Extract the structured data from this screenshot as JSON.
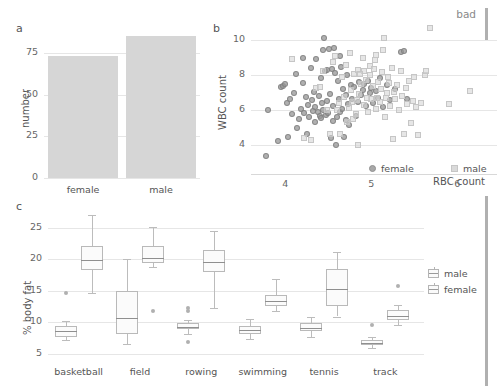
{
  "annotation": {
    "bad_label": "bad"
  },
  "panels": {
    "a": {
      "letter": "a",
      "ylabel": "number",
      "yticks": [
        "0",
        "25",
        "50",
        "75"
      ],
      "categories": [
        "female",
        "male"
      ]
    },
    "b": {
      "letter": "b",
      "ylabel": "WBC count",
      "xlabel": "RBC count",
      "yticks": [
        "4",
        "6",
        "8",
        "10"
      ],
      "xticks": [
        "4",
        "5",
        "6"
      ],
      "legend": [
        "female",
        "male"
      ]
    },
    "c": {
      "letter": "c",
      "ylabel": "% body fat",
      "yticks": [
        "5",
        "10",
        "15",
        "20",
        "25"
      ],
      "categories": [
        "basketball",
        "field",
        "rowing",
        "swimming",
        "tennis",
        "track"
      ],
      "legend": [
        "male",
        "female"
      ]
    }
  },
  "colors": {
    "bar_fill": "#d6d6d6",
    "female_point": "#999999",
    "male_point": "#d6d6d6",
    "grid": "#e6e6e6",
    "text": "#555555",
    "box_stroke": "#b9b9b9",
    "median": "#8f8f8f"
  },
  "chart_data": [
    {
      "id": "panel-a",
      "type": "bar",
      "title": "",
      "xlabel": "",
      "ylabel": "number",
      "categories": [
        "female",
        "male"
      ],
      "values": [
        73,
        85
      ],
      "ylim": [
        0,
        90
      ],
      "yticks": [
        0,
        25,
        50,
        75
      ],
      "grid": true
    },
    {
      "id": "panel-b",
      "type": "scatter",
      "title": "",
      "xlabel": "RBC count",
      "ylabel": "WBC count",
      "xlim": [
        3.6,
        6.3
      ],
      "ylim": [
        3.0,
        11.0
      ],
      "xticks": [
        4,
        5,
        6
      ],
      "yticks": [
        4,
        6,
        8,
        10
      ],
      "grid": true,
      "legend": [
        "female",
        "male"
      ],
      "legend_position": "bottom-right",
      "series": [
        {
          "name": "female",
          "marker": "circle",
          "color": "#999999",
          "points": [
            [
              3.78,
              3.35
            ],
            [
              3.8,
              5.98
            ],
            [
              3.92,
              4.18
            ],
            [
              3.95,
              7.3
            ],
            [
              3.97,
              7.35
            ],
            [
              4.0,
              7.45
            ],
            [
              4.02,
              6.4
            ],
            [
              4.03,
              4.45
            ],
            [
              4.05,
              6.62
            ],
            [
              4.08,
              5.72
            ],
            [
              4.1,
              6.95
            ],
            [
              4.12,
              8.05
            ],
            [
              4.14,
              4.95
            ],
            [
              4.16,
              5.48
            ],
            [
              4.18,
              6.05
            ],
            [
              4.2,
              7.52
            ],
            [
              4.21,
              8.92
            ],
            [
              4.22,
              5.8
            ],
            [
              4.24,
              6.7
            ],
            [
              4.25,
              4.62
            ],
            [
              4.26,
              6.25
            ],
            [
              4.28,
              5.58
            ],
            [
              4.3,
              8.38
            ],
            [
              4.31,
              6.52
            ],
            [
              4.32,
              5.92
            ],
            [
              4.33,
              7.02
            ],
            [
              4.34,
              6.12
            ],
            [
              4.35,
              5.3
            ],
            [
              4.36,
              8.9
            ],
            [
              4.38,
              5.85
            ],
            [
              4.39,
              6.78
            ],
            [
              4.4,
              5.62
            ],
            [
              4.41,
              7.78
            ],
            [
              4.42,
              5.5
            ],
            [
              4.43,
              6.38
            ],
            [
              4.44,
              5.95
            ],
            [
              4.45,
              10.1
            ],
            [
              4.46,
              8.22
            ],
            [
              4.47,
              5.7
            ],
            [
              4.48,
              6.48
            ],
            [
              4.49,
              8.28
            ],
            [
              4.5,
              5.78
            ],
            [
              4.51,
              9.48
            ],
            [
              4.52,
              6.9
            ],
            [
              4.53,
              4.4
            ],
            [
              4.54,
              8.3
            ],
            [
              4.55,
              5.35
            ],
            [
              4.56,
              6.18
            ],
            [
              4.57,
              9.52
            ],
            [
              4.58,
              8.1
            ],
            [
              4.59,
              3.98
            ],
            [
              4.6,
              5.55
            ],
            [
              4.61,
              7.62
            ],
            [
              4.62,
              6.58
            ],
            [
              4.63,
              9.08
            ],
            [
              4.64,
              5.88
            ],
            [
              4.65,
              8.45
            ],
            [
              4.66,
              6.05
            ],
            [
              4.67,
              7.18
            ],
            [
              4.68,
              4.42
            ],
            [
              4.7,
              5.42
            ],
            [
              4.71,
              6.85
            ],
            [
              4.72,
              7.95
            ],
            [
              4.73,
              6.3
            ],
            [
              4.74,
              5.12
            ],
            [
              4.76,
              7.4
            ],
            [
              4.78,
              6.62
            ],
            [
              4.8,
              7.28
            ],
            [
              4.82,
              5.65
            ],
            [
              4.84,
              6.45
            ],
            [
              4.86,
              7.55
            ],
            [
              4.88,
              6.82
            ],
            [
              4.9,
              7.12
            ],
            [
              4.92,
              7.45
            ],
            [
              4.94,
              6.2
            ],
            [
              4.96,
              7.65
            ],
            [
              4.98,
              6.95
            ],
            [
              5.0,
              7.22
            ],
            [
              5.02,
              6.35
            ],
            [
              5.05,
              7.05
            ],
            [
              5.08,
              6.68
            ],
            [
              5.1,
              7.82
            ],
            [
              5.14,
              6.15
            ],
            [
              5.18,
              7.38
            ],
            [
              5.22,
              6.55
            ],
            [
              5.28,
              7.2
            ],
            [
              5.34,
              9.3
            ],
            [
              5.38,
              9.35
            ],
            [
              5.42,
              6.6
            ],
            [
              4.44,
              9.42
            ]
          ]
        },
        {
          "name": "male",
          "marker": "square",
          "color": "#d6d6d6",
          "points": [
            [
              4.08,
              8.88
            ],
            [
              4.22,
              4.35
            ],
            [
              4.3,
              4.28
            ],
            [
              4.36,
              7.22
            ],
            [
              4.4,
              7.3
            ],
            [
              4.44,
              8.18
            ],
            [
              4.48,
              6.0
            ],
            [
              4.52,
              4.62
            ],
            [
              4.56,
              8.72
            ],
            [
              4.58,
              9.05
            ],
            [
              4.6,
              5.95
            ],
            [
              4.62,
              6.35
            ],
            [
              4.64,
              4.58
            ],
            [
              4.66,
              7.88
            ],
            [
              4.68,
              6.72
            ],
            [
              4.7,
              8.55
            ],
            [
              4.72,
              5.3
            ],
            [
              4.74,
              6.1
            ],
            [
              4.75,
              9.22
            ],
            [
              4.76,
              7.12
            ],
            [
              4.78,
              6.45
            ],
            [
              4.8,
              8.02
            ],
            [
              4.82,
              5.72
            ],
            [
              4.84,
              8.28
            ],
            [
              4.85,
              3.95
            ],
            [
              4.86,
              6.88
            ],
            [
              4.88,
              7.48
            ],
            [
              4.9,
              8.92
            ],
            [
              4.92,
              6.28
            ],
            [
              4.94,
              7.7
            ],
            [
              4.96,
              5.88
            ],
            [
              4.98,
              8.48
            ],
            [
              5.0,
              6.62
            ],
            [
              5.02,
              7.32
            ],
            [
              5.04,
              8.82
            ],
            [
              5.05,
              9.1
            ],
            [
              5.06,
              6.02
            ],
            [
              5.08,
              7.58
            ],
            [
              5.1,
              6.42
            ],
            [
              5.12,
              8.12
            ],
            [
              5.14,
              9.38
            ],
            [
              5.15,
              10.08
            ],
            [
              5.16,
              5.6
            ],
            [
              5.18,
              6.92
            ],
            [
              5.2,
              7.85
            ],
            [
              5.22,
              6.22
            ],
            [
              5.24,
              8.38
            ],
            [
              5.25,
              4.32
            ],
            [
              5.26,
              7.02
            ],
            [
              5.28,
              6.58
            ],
            [
              5.3,
              7.42
            ],
            [
              5.32,
              5.98
            ],
            [
              5.34,
              8.22
            ],
            [
              5.36,
              6.78
            ],
            [
              5.38,
              4.62
            ],
            [
              5.4,
              7.25
            ],
            [
              5.42,
              6.32
            ],
            [
              5.44,
              7.62
            ],
            [
              5.46,
              5.25
            ],
            [
              5.48,
              6.5
            ],
            [
              5.5,
              7.88
            ],
            [
              5.52,
              6.15
            ],
            [
              5.54,
              4.55
            ],
            [
              5.58,
              6.35
            ],
            [
              5.62,
              7.95
            ],
            [
              5.64,
              8.22
            ],
            [
              5.68,
              10.65
            ],
            [
              5.9,
              6.32
            ],
            [
              6.15,
              7.08
            ],
            [
              4.95,
              6.68
            ],
            [
              5.07,
              6.68
            ],
            [
              5.11,
              7.18
            ],
            [
              4.99,
              7.95
            ],
            [
              5.03,
              8.32
            ],
            [
              4.91,
              8.22
            ],
            [
              4.87,
              8.02
            ],
            [
              4.83,
              6.55
            ],
            [
              4.79,
              5.45
            ],
            [
              5.17,
              6.65
            ],
            [
              5.21,
              7.52
            ]
          ]
        }
      ]
    },
    {
      "id": "panel-c",
      "type": "box",
      "title": "",
      "xlabel": "",
      "ylabel": "% body fat",
      "categories": [
        "basketball",
        "field",
        "rowing",
        "swimming",
        "tennis",
        "track"
      ],
      "ylim": [
        4.0,
        27.0
      ],
      "yticks": [
        5,
        10,
        15,
        20,
        25
      ],
      "grid": true,
      "legend": [
        "male",
        "female"
      ],
      "legend_position": "right",
      "series": [
        {
          "name": "male",
          "boxes": [
            {
              "category": "basketball",
              "whisker_low": 7.2,
              "q1": 7.6,
              "median": 8.6,
              "q3": 9.4,
              "whisker_high": 10.2,
              "outliers": [
                14.7
              ]
            },
            {
              "category": "field",
              "whisker_low": 6.5,
              "q1": 8.1,
              "median": 10.7,
              "q3": 15.0,
              "whisker_high": 20.0,
              "outliers": []
            },
            {
              "category": "rowing",
              "whisker_low": 8.2,
              "q1": 8.9,
              "median": 9.3,
              "q3": 9.8,
              "whisker_high": 10.4,
              "outliers": [
                11.8,
                12.2,
                6.9
              ]
            },
            {
              "category": "swimming",
              "whisker_low": 7.3,
              "q1": 8.1,
              "median": 8.7,
              "q3": 9.4,
              "whisker_high": 10.5,
              "outliers": []
            },
            {
              "category": "tennis",
              "whisker_low": 7.6,
              "q1": 8.6,
              "median": 9.1,
              "q3": 9.9,
              "whisker_high": 10.8,
              "outliers": []
            },
            {
              "category": "track",
              "whisker_low": 5.9,
              "q1": 6.3,
              "median": 6.7,
              "q3": 7.2,
              "whisker_high": 7.6,
              "outliers": [
                9.5
              ]
            }
          ]
        },
        {
          "name": "female",
          "boxes": [
            {
              "category": "basketball",
              "whisker_low": 14.7,
              "q1": 18.2,
              "median": 19.9,
              "q3": 22.1,
              "whisker_high": 27.0,
              "outliers": []
            },
            {
              "category": "field",
              "whisker_low": 18.8,
              "q1": 19.4,
              "median": 20.2,
              "q3": 22.1,
              "whisker_high": 25.1,
              "outliers": [
                11.7
              ]
            },
            {
              "category": "rowing",
              "whisker_low": 12.2,
              "q1": 17.9,
              "median": 19.6,
              "q3": 21.4,
              "whisker_high": 24.5,
              "outliers": []
            },
            {
              "category": "swimming",
              "whisker_low": 11.8,
              "q1": 12.5,
              "median": 13.3,
              "q3": 14.3,
              "whisker_high": 16.8,
              "outliers": []
            },
            {
              "category": "tennis",
              "whisker_low": 10.9,
              "q1": 12.6,
              "median": 15.3,
              "q3": 18.4,
              "whisker_high": 21.2,
              "outliers": []
            },
            {
              "category": "track",
              "whisker_low": 9.5,
              "q1": 10.3,
              "median": 11.0,
              "q3": 11.9,
              "whisker_high": 12.7,
              "outliers": [
                15.8
              ]
            }
          ]
        }
      ]
    }
  ]
}
